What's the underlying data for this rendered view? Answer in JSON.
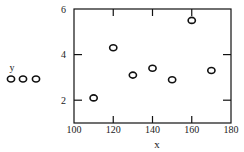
{
  "chart_data": {
    "type": "scatter",
    "title": "",
    "xlabel": "x",
    "ylabel": "",
    "xlim": [
      100,
      180
    ],
    "ylim": [
      1,
      6
    ],
    "x_ticks": [
      100,
      120,
      140,
      160,
      180
    ],
    "y_ticks": [
      2,
      4,
      6
    ],
    "grid": false,
    "legend": {
      "position": "left",
      "entries": [
        {
          "label": "y",
          "marker": "open-circle"
        }
      ]
    },
    "series": [
      {
        "name": "y",
        "marker": "open-circle",
        "points": [
          {
            "x": 110,
            "y": 2.1
          },
          {
            "x": 120,
            "y": 4.3
          },
          {
            "x": 130,
            "y": 3.1
          },
          {
            "x": 140,
            "y": 3.4
          },
          {
            "x": 150,
            "y": 2.9
          },
          {
            "x": 160,
            "y": 5.5
          },
          {
            "x": 170,
            "y": 3.3
          }
        ]
      }
    ]
  },
  "labels": {
    "x_axis": "x",
    "legend_label": "y",
    "x_ticks": [
      "100",
      "120",
      "140",
      "160",
      "180"
    ],
    "y_ticks": [
      "2",
      "4",
      "6"
    ]
  },
  "colors": {
    "ink": "#111111",
    "background": "#ffffff"
  }
}
